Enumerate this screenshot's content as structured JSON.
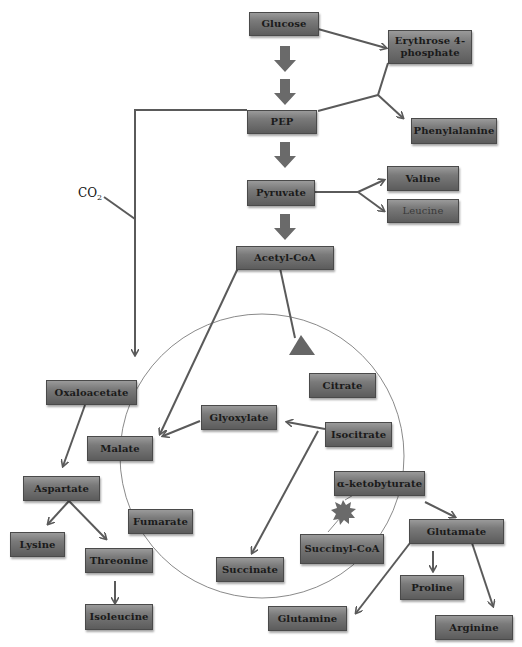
{
  "diagram": {
    "type": "metabolic-pathway",
    "nodes": {
      "glucose": "Glucose",
      "erythrose": "Erythrose 4-phosphate",
      "pep": "PEP",
      "phenylalanine": "Phenylalanine",
      "pyruvate": "Pyruvate",
      "valine": "Valine",
      "leucine": "Leucine",
      "acetyl_coa": "Acetyl-CoA",
      "oxaloacetate": "Oxaloacetate",
      "citrate": "Citrate",
      "glyoxylate": "Glyoxylate",
      "malate": "Malate",
      "isocitrate": "Isocitrate",
      "aspartate": "Aspartate",
      "alpha_keto": "α-ketobyturate",
      "fumarate": "Fumarate",
      "lysine": "Lysine",
      "threonine": "Threonine",
      "succinyl_coa": "Succinyl-CoA",
      "glutamate": "Glutamate",
      "succinate": "Succinate",
      "proline": "Proline",
      "isoleucine": "Isoleucine",
      "glutamine": "Glutamine",
      "arginine": "Arginine"
    },
    "annotations": {
      "co2": "CO",
      "co2_sub": "2"
    },
    "edges": [
      [
        "Glucose",
        "PEP"
      ],
      [
        "Glucose",
        "Erythrose 4-phosphate"
      ],
      [
        "Erythrose 4-phosphate + PEP",
        "Phenylalanine"
      ],
      [
        "PEP",
        "Pyruvate"
      ],
      [
        "PEP",
        "Oxaloacetate"
      ],
      [
        "Pyruvate",
        "Valine"
      ],
      [
        "Pyruvate",
        "Leucine"
      ],
      [
        "Pyruvate",
        "Acetyl-CoA"
      ],
      [
        "Acetyl-CoA",
        "Citrate"
      ],
      [
        "Acetyl-CoA",
        "Malate"
      ],
      [
        "Isocitrate",
        "Glyoxylate"
      ],
      [
        "Glyoxylate",
        "Malate"
      ],
      [
        "Isocitrate",
        "Succinate"
      ],
      [
        "Oxaloacetate",
        "Aspartate"
      ],
      [
        "Aspartate",
        "Lysine"
      ],
      [
        "Aspartate",
        "Threonine"
      ],
      [
        "Threonine",
        "Isoleucine"
      ],
      [
        "α-ketobyturate",
        "Glutamate"
      ],
      [
        "Glutamate",
        "Proline"
      ],
      [
        "Glutamate",
        "Glutamine"
      ],
      [
        "Glutamate",
        "Arginine"
      ]
    ],
    "colors": {
      "box_top": "#9a9a9a",
      "box_bottom": "#5c5c5c",
      "arrow": "#5a5a5a",
      "cycle": "#8a8a8a"
    }
  }
}
